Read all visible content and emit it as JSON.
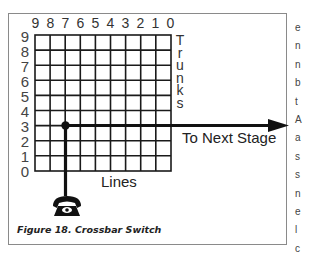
{
  "figure": {
    "caption": "Figure 18.  Crossbar Switch",
    "top_labels": [
      "9",
      "8",
      "7",
      "6",
      "5",
      "4",
      "3",
      "2",
      "1",
      "0"
    ],
    "left_labels": [
      "9",
      "8",
      "7",
      "6",
      "5",
      "4",
      "3",
      "2",
      "1",
      "0"
    ],
    "vertical_axis_title": "Trunks",
    "trunk_letters": [
      "T",
      "r",
      "u",
      "n",
      "k",
      "s"
    ],
    "horizontal_axis_title": "Lines",
    "arrow_label": "To Next Stage",
    "connection": {
      "line": "7",
      "trunk": "3"
    },
    "colors": {
      "line": "#1a1a1a",
      "border": "#8a8a8a"
    }
  },
  "body_text_fragments": [
    "e",
    "n",
    "n",
    "b",
    "t",
    "A",
    "a",
    "s",
    "s",
    "n",
    "e",
    "l",
    "c"
  ]
}
